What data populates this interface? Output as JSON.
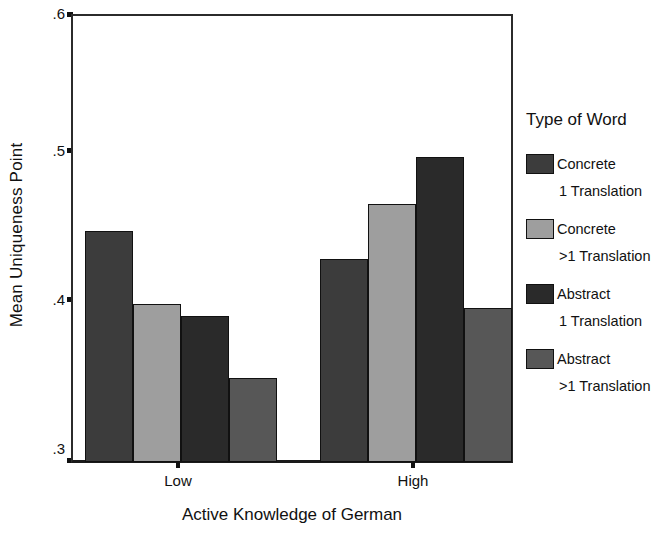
{
  "chart_data": {
    "type": "bar",
    "title": "",
    "xlabel": "Active Knowledge of German",
    "ylabel": "Mean Uniqueness Point",
    "categories": [
      "Low",
      "High"
    ],
    "ylim": [
      0.3,
      0.6
    ],
    "yticks": [
      ".3",
      ".4",
      ".5",
      ".6"
    ],
    "ytick_values": [
      0.3,
      0.4,
      0.5,
      0.6
    ],
    "grid": false,
    "legend_position": "right",
    "legend_title": "Type of Word",
    "series": [
      {
        "name": "Concrete 1 Translation",
        "name_line1": "Concrete",
        "name_line2": "1 Translation",
        "color": "#3c3c3c",
        "values": [
          0.455,
          0.436
        ]
      },
      {
        "name": "Concrete >1 Translation",
        "name_line1": "Concrete",
        "name_line2": ">1 Translation",
        "color": "#9e9e9e",
        "values": [
          0.406,
          0.473
        ]
      },
      {
        "name": "Abstract 1 Translation",
        "name_line1": "Abstract",
        "name_line2": "1 Translation",
        "color": "#2a2a2a",
        "values": [
          0.398,
          0.504
        ]
      },
      {
        "name": "Abstract >1 Translation",
        "name_line1": "Abstract",
        "name_line2": ">1 Translation",
        "color": "#575757",
        "values": [
          0.356,
          0.403
        ]
      }
    ]
  },
  "axes": {
    "y_title": "Mean Uniqueness Point",
    "x_title": "Active Knowledge of German",
    "y_tick_labels": [
      ".6",
      ".5",
      ".4",
      ".3"
    ],
    "x_tick_labels": [
      "Low",
      "High"
    ]
  },
  "legend": {
    "title": "Type of Word",
    "entries": [
      {
        "line1": "Concrete",
        "line2": "1 Translation",
        "color": "#3c3c3c"
      },
      {
        "line1": "Concrete",
        "line2": ">1 Translation",
        "color": "#9e9e9e"
      },
      {
        "line1": "Abstract",
        "line2": "1 Translation",
        "color": "#2a2a2a"
      },
      {
        "line1": "Abstract",
        "line2": ">1 Translation",
        "color": "#575757"
      }
    ]
  }
}
